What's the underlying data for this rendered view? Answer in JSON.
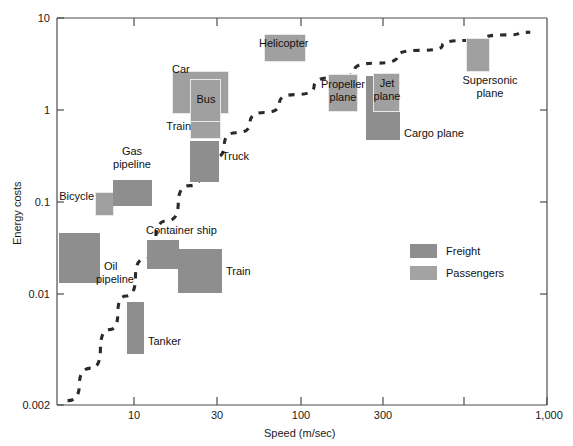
{
  "chart_data": {
    "type": "scatter",
    "title": "",
    "xlabel": "Speed (m/sec)",
    "ylabel": "Energy costs",
    "xscale": "log",
    "yscale": "log",
    "xlim": [
      3,
      1000
    ],
    "ylim": [
      0.002,
      10
    ],
    "grid": false,
    "legend_position": "center-right",
    "xticks": [
      {
        "value": 10,
        "label": "10"
      },
      {
        "value": 30,
        "label": "30"
      },
      {
        "value": 100,
        "label": "100"
      },
      {
        "value": 300,
        "label": "300"
      },
      {
        "value": 1000,
        "label": "1,000"
      }
    ],
    "xticks_unlabeled": [
      600
    ],
    "yticks": [
      {
        "value": 10,
        "label": "10"
      },
      {
        "value": 1,
        "label": "1"
      },
      {
        "value": 0.1,
        "label": "0.1"
      },
      {
        "value": 0.01,
        "label": "0.01"
      },
      {
        "value": 0.002,
        "label": "0.002"
      }
    ],
    "series": [
      {
        "name": "Freight",
        "color": "#8e8e8e",
        "boxes": [
          {
            "label": "Oil pipeline",
            "x_range": [
              3.6,
              6.6
            ],
            "y_range": [
              0.0125,
              0.059
            ]
          },
          {
            "label": "Gas pipeline",
            "x_range": [
              7.9,
              14.0
            ],
            "y_range": [
              0.105,
              0.2
            ]
          },
          {
            "label": "Tanker",
            "x_range": [
              9.1,
              10.9
            ],
            "y_range": [
              0.0016,
              0.0115
            ]
          },
          {
            "label": "Container ship",
            "x_range": [
              12.6,
              17.0
            ],
            "y_range": [
              0.026,
              0.047
            ]
          },
          {
            "label": "Train",
            "x_range": [
              17.0,
              26.5
            ],
            "y_range": [
              0.0135,
              0.0375
            ]
          },
          {
            "label": "Truck",
            "x_range": [
              20.0,
              26.5
            ],
            "y_range": [
              0.25,
              0.55
            ]
          },
          {
            "label": "Cargo plane",
            "x_range": [
              255,
              330
            ],
            "y_range": [
              0.65,
              2.1
            ]
          }
        ]
      },
      {
        "name": "Passengers",
        "color": "#a0a0a0",
        "boxes": [
          {
            "label": "Bicycle",
            "x_range": [
              5.6,
              7.2
            ],
            "y_range": [
              0.082,
              0.145
            ]
          },
          {
            "label": "Car",
            "x_range": [
              18.5,
              33.0
            ],
            "y_range": [
              1.0,
              2.6
            ]
          },
          {
            "label": "Bus",
            "x_range": [
              21.5,
              28.0
            ],
            "y_range": [
              0.78,
              2.25
            ]
          },
          {
            "label": "Train",
            "x_range": [
              21.5,
              28.0
            ],
            "y_range": [
              0.54,
              0.82
            ]
          },
          {
            "label": "Helicopter",
            "x_range": [
              72,
              105
            ],
            "y_range": [
              3.7,
              6.3
            ]
          },
          {
            "label": "Propeller plane",
            "x_range": [
              148,
              200
            ],
            "y_range": [
              1.2,
              2.45
            ]
          },
          {
            "label": "Jet plane",
            "x_range": [
              270,
              320
            ],
            "y_range": [
              1.25,
              2.5
            ]
          },
          {
            "label": "Supersonic plane",
            "x_range": [
              585,
              660
            ],
            "y_range": [
              2.4,
              6.2
            ]
          }
        ]
      }
    ],
    "trend_line": {
      "style": "dashed",
      "color": "#2a2a2a",
      "points": [
        {
          "x": 3.4,
          "y": 0.0022
        },
        {
          "x": 4.5,
          "y": 0.0045
        },
        {
          "x": 5.6,
          "y": 0.0105
        },
        {
          "x": 6.8,
          "y": 0.022
        },
        {
          "x": 8.5,
          "y": 0.05
        },
        {
          "x": 11.0,
          "y": 0.115
        },
        {
          "x": 14.5,
          "y": 0.25
        },
        {
          "x": 19.0,
          "y": 0.46
        },
        {
          "x": 25.0,
          "y": 0.8
        },
        {
          "x": 35.0,
          "y": 1.25
        },
        {
          "x": 50.0,
          "y": 1.85
        },
        {
          "x": 80.0,
          "y": 2.7
        },
        {
          "x": 130.0,
          "y": 3.7
        },
        {
          "x": 220.0,
          "y": 4.9
        },
        {
          "x": 380.0,
          "y": 6.1
        },
        {
          "x": 620.0,
          "y": 6.9
        },
        {
          "x": 820.0,
          "y": 7.3
        }
      ]
    }
  },
  "labels": {
    "oil_pipeline": "Oil\npipeline",
    "oil_pipeline_line1": "Oil",
    "oil_pipeline_line2": "pipeline",
    "gas_pipeline_line1": "Gas",
    "gas_pipeline_line2": "pipeline",
    "bicycle": "Bicycle",
    "tanker": "Tanker",
    "container_ship": "Container ship",
    "train_freight": "Train",
    "train_passenger": "Train",
    "truck": "Truck",
    "car": "Car",
    "bus": "Bus",
    "helicopter": "Helicopter",
    "propeller_plane_line1": "Propeller",
    "propeller_plane_line2": "plane",
    "jet_plane_line1": "Jet",
    "jet_plane_line2": "plane",
    "cargo_plane": "Cargo plane",
    "supersonic_plane_line1": "Supersonic",
    "supersonic_plane_line2": "plane"
  },
  "legend": {
    "items": [
      {
        "label": "Freight",
        "color": "#8e8e8e"
      },
      {
        "label": "Passengers",
        "color": "#a3a3a3"
      }
    ]
  },
  "axes": {
    "x_title": "Speed (m/sec)",
    "y_title": "Energy costs",
    "x_tick_labels": [
      "10",
      "30",
      "100",
      "300",
      "1,000"
    ],
    "y_tick_labels": [
      "10",
      "1",
      "0.1",
      "0.01",
      "0.002"
    ]
  }
}
